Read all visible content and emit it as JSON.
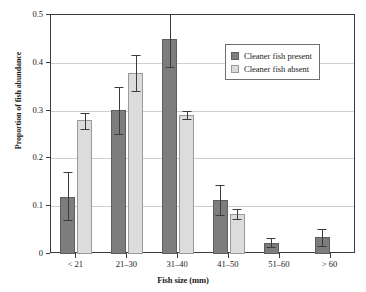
{
  "chart_data": {
    "type": "bar",
    "title": "",
    "xlabel": "Fish size (mm)",
    "ylabel": "Proportion of fish abundance",
    "categories": [
      "< 21",
      "21–30",
      "31–40",
      "41–50",
      "51–60",
      "> 60"
    ],
    "ylim": [
      0,
      0.5
    ],
    "ytick_labels": [
      "0",
      "0.1",
      "0.2",
      "0.3",
      "0.4",
      "0.5"
    ],
    "ytick_values": [
      0,
      0.1,
      0.2,
      0.3,
      0.4,
      0.5
    ],
    "grid": true,
    "legend_position": "top-right",
    "series": [
      {
        "name": "Cleaner fish present",
        "color": "#7d7d7d",
        "values": [
          0.12,
          0.302,
          0.45,
          0.113,
          0.024,
          0.035
        ],
        "err_low": [
          0.072,
          0.252,
          0.391,
          0.082,
          0.015,
          0.017
        ],
        "err_high": [
          0.172,
          0.349,
          0.505,
          0.145,
          0.034,
          0.052
        ]
      },
      {
        "name": "Cleaner fish absent",
        "color": "#dcdcdc",
        "values": [
          0.28,
          0.378,
          0.291,
          0.084,
          null,
          null
        ],
        "err_low": [
          0.262,
          0.342,
          0.283,
          0.073,
          null,
          null
        ],
        "err_high": [
          0.296,
          0.416,
          0.299,
          0.094,
          null,
          null
        ]
      }
    ]
  },
  "legend": {
    "items": [
      {
        "label": "Cleaner fish present",
        "swatch": "present"
      },
      {
        "label": "Cleaner fish absent",
        "swatch": "absent"
      }
    ]
  }
}
